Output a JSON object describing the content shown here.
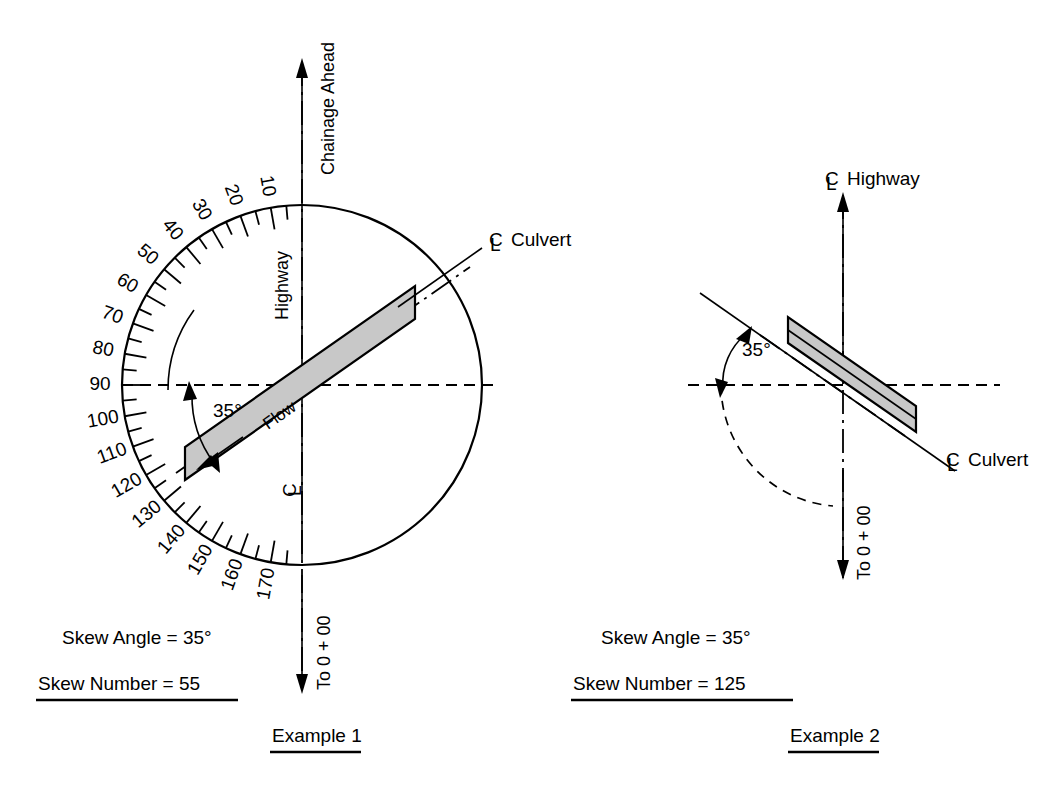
{
  "figure": {
    "background_color": "#ffffff",
    "line_color": "#000000",
    "culvert_fill_color": "#c8c8c8"
  },
  "example1": {
    "name": "Example 1",
    "protractor": {
      "center": [
        302,
        385
      ],
      "radius": 180,
      "tick_labels": [
        "10",
        "20",
        "30",
        "40",
        "50",
        "60",
        "70",
        "80",
        "90",
        "100",
        "110",
        "120",
        "130",
        "140",
        "150",
        "160",
        "170"
      ],
      "tick_values": [
        10,
        20,
        30,
        40,
        50,
        60,
        70,
        80,
        90,
        100,
        110,
        120,
        130,
        140,
        150,
        160,
        170
      ],
      "minor_tick_step": 5,
      "label_step": 10,
      "scale_direction": "counterclockwise-from-bottom"
    },
    "labels": {
      "chainage_ahead": "Chainage Ahead",
      "highway": "Highway",
      "centerline_symbol": "C",
      "centerline_symbol_overlay": "L",
      "culvert": "Culvert",
      "to_zero": "To 0 + 00",
      "flow": "Flow",
      "angle": "35°"
    },
    "skew_angle_text": "Skew Angle = 35°",
    "skew_number_text": "Skew Number = 55",
    "skew_angle_value": 35,
    "skew_number_value": 55,
    "culvert_bearing_deg": 35,
    "caption": "Example 1"
  },
  "example2": {
    "name": "Example 2",
    "labels": {
      "highway": "Highway",
      "centerline_symbol": "C",
      "centerline_symbol_overlay": "L",
      "culvert": "Culvert",
      "to_zero": "To 0 + 00",
      "angle": "35°"
    },
    "skew_angle_text": "Skew Angle = 35°",
    "skew_number_text": "Skew Number = 125",
    "skew_angle_value": 35,
    "skew_number_value": 125,
    "culvert_bearing_deg": 125,
    "caption": "Example 2"
  }
}
